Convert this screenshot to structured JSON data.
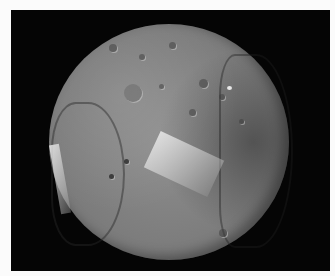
{
  "image": {
    "subject": "Miranda (moon of Uranus)",
    "alt": "Grayscale image of a heavily cratered, grooved moon on a black background",
    "colors": {
      "background": "#fbfbfb",
      "space": "#050505",
      "surface": "#8a8a8a"
    }
  }
}
